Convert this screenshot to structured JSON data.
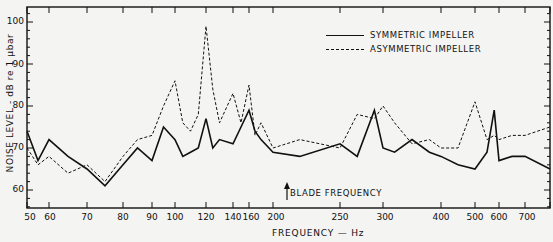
{
  "chart_data": {
    "type": "line",
    "title": "",
    "xlabel": "FREQUENCY — Hz",
    "ylabel": "NOISE LEVEL - dB re 1 μbar",
    "x_scale": "nonlinear (log-like)",
    "xlim": [
      50,
      750
    ],
    "ylim": [
      55,
      103
    ],
    "x_ticks": [
      "50",
      "60",
      "70",
      "80",
      "90",
      "100",
      "120",
      "140",
      "160",
      "200",
      "250",
      "300",
      "400",
      "500",
      "600",
      "700"
    ],
    "y_ticks": [
      "60",
      "70",
      "80",
      "90",
      "100"
    ],
    "grid": false,
    "legend_position": "upper right",
    "legend": [
      "SYMMETRIC IMPELLER",
      "ASYMMETRIC IMPELLER"
    ],
    "annotations": [
      {
        "text": "BLADE FREQUENCY",
        "x": 290,
        "note": "upward arrow at ~290 Hz"
      }
    ],
    "x": [
      50,
      55,
      60,
      65,
      70,
      75,
      80,
      85,
      90,
      95,
      100,
      105,
      110,
      115,
      120,
      125,
      130,
      140,
      150,
      160,
      170,
      180,
      200,
      220,
      250,
      270,
      290,
      300,
      320,
      350,
      380,
      400,
      450,
      500,
      550,
      580,
      600,
      650,
      700,
      750
    ],
    "series": [
      {
        "name": "SYMMETRIC IMPELLER",
        "style": "solid",
        "values": [
          74,
          67,
          72,
          68,
          65,
          61,
          66,
          70,
          67,
          75,
          72,
          68,
          69,
          70,
          77,
          70,
          72,
          71,
          75,
          79,
          74,
          72,
          69,
          68,
          71,
          68,
          79,
          70,
          69,
          72,
          69,
          68,
          66,
          65,
          69,
          79,
          67,
          68,
          68,
          65
        ]
      },
      {
        "name": "ASYMMETRIC IMPELLER",
        "style": "dashed",
        "values": [
          70,
          66,
          68,
          64,
          66,
          62,
          68,
          72,
          73,
          80,
          86,
          76,
          74,
          78,
          99,
          84,
          76,
          83,
          76,
          85,
          73,
          76,
          70,
          72,
          70,
          78,
          77,
          80,
          76,
          71,
          72,
          70,
          70,
          81,
          72,
          73,
          72,
          73,
          73,
          75
        ]
      }
    ]
  },
  "labels": {
    "ylabel": "NOISE LEVEL - dB re 1 μbar",
    "xlabel": "FREQUENCY — Hz",
    "legend_sym": "SYMMETRIC IMPELLER",
    "legend_asym": "ASYMMETRIC IMPELLER",
    "annotation": "BLADE FREQUENCY",
    "yt": [
      "100",
      "90",
      "80",
      "70",
      "60"
    ],
    "xt": [
      "50",
      "60",
      "70",
      "80",
      "90",
      "100",
      "120",
      "140",
      "160",
      "200",
      "250",
      "300",
      "400",
      "500",
      "600",
      "700"
    ]
  }
}
